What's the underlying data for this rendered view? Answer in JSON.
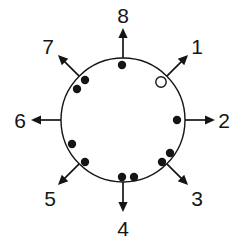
{
  "figure": {
    "type": "circular-direction-diagram",
    "background_color": "#ffffff",
    "stroke_color": "#151515",
    "dot_fill_color": "#151515",
    "open_marker_fill": "#ffffff",
    "circle": {
      "cx": 123,
      "cy": 120,
      "r": 62,
      "stroke_width": 1.4
    }
  },
  "directions": [
    {
      "label": "1",
      "angle_deg": 45,
      "label_x": 197,
      "label_y": 46,
      "arrow_start_r": 62,
      "arrow_end_r": 92
    },
    {
      "label": "2",
      "angle_deg": 0,
      "label_x": 224,
      "label_y": 120,
      "arrow_start_r": 62,
      "arrow_end_r": 92
    },
    {
      "label": "3",
      "angle_deg": -45,
      "label_x": 197,
      "label_y": 198,
      "arrow_start_r": 62,
      "arrow_end_r": 92
    },
    {
      "label": "4",
      "angle_deg": -90,
      "label_x": 123,
      "label_y": 228,
      "arrow_start_r": 62,
      "arrow_end_r": 92
    },
    {
      "label": "5",
      "angle_deg": -135,
      "label_x": 50,
      "label_y": 198,
      "arrow_start_r": 62,
      "arrow_end_r": 92
    },
    {
      "label": "6",
      "angle_deg": 180,
      "label_x": 20,
      "label_y": 120,
      "arrow_start_r": 62,
      "arrow_end_r": 92
    },
    {
      "label": "7",
      "angle_deg": 135,
      "label_x": 48,
      "label_y": 46,
      "arrow_start_r": 62,
      "arrow_end_r": 92
    },
    {
      "label": "8",
      "angle_deg": 90,
      "label_x": 123,
      "label_y": 15,
      "arrow_start_r": 62,
      "arrow_end_r": 92
    }
  ],
  "markers": {
    "filled_dot_radius": 4.2,
    "open_marker_radius": 5.2,
    "filled_dots": [
      {
        "name": "dot-top",
        "x": 122,
        "y": 65
      },
      {
        "name": "dot-upper-left-a",
        "x": 85,
        "y": 80
      },
      {
        "name": "dot-upper-left-b",
        "x": 77,
        "y": 89
      },
      {
        "name": "dot-right",
        "x": 177,
        "y": 120
      },
      {
        "name": "dot-left-lower",
        "x": 72,
        "y": 144
      },
      {
        "name": "dot-lower-left",
        "x": 85,
        "y": 162
      },
      {
        "name": "dot-bottom-a",
        "x": 122,
        "y": 177
      },
      {
        "name": "dot-bottom-b",
        "x": 134,
        "y": 177
      },
      {
        "name": "dot-lower-right-a",
        "x": 170,
        "y": 153
      },
      {
        "name": "dot-lower-right-b",
        "x": 162,
        "y": 162
      }
    ],
    "open_markers": [
      {
        "name": "open-circle-upper-right",
        "x": 161,
        "y": 82
      }
    ]
  }
}
